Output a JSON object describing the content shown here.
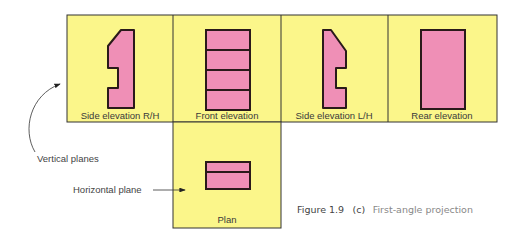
{
  "colors": {
    "plane_fill": "#fbf68a",
    "view_fill": "#ef8fb6",
    "outline": "#2a1a1a",
    "panel_border": "#333333"
  },
  "panels": {
    "side_rh": {
      "label": "Side elevation R/H"
    },
    "front": {
      "label": "Front elevation"
    },
    "side_lh": {
      "label": "Side elevation L/H"
    },
    "rear": {
      "label": "Rear elevation"
    },
    "plan": {
      "label": "Plan"
    }
  },
  "annotations": {
    "vertical_planes": "Vertical planes",
    "horizontal_plane": "Horizontal plane"
  },
  "caption": {
    "number": "Figure 1.9",
    "part": "(c)",
    "title": "First-angle projection"
  }
}
